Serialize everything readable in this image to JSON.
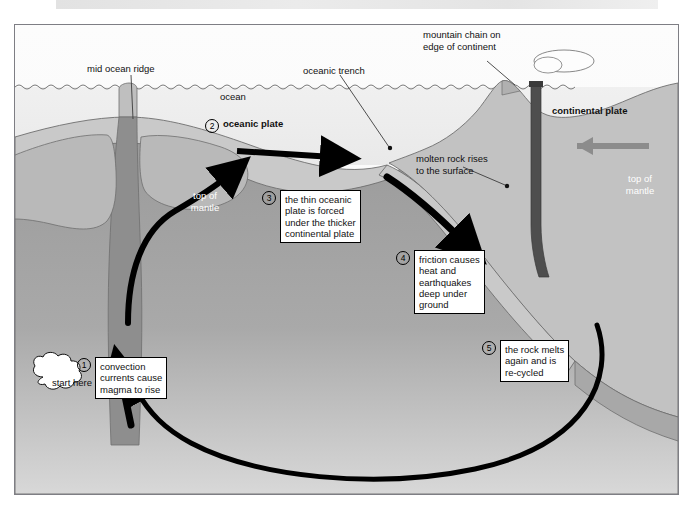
{
  "figure": {
    "border_color": "#7e7e84"
  },
  "palette": {
    "sky": "#fbfbfb",
    "ocean": "#ededed",
    "crust_light": "#c9c9c9",
    "mantle_dark": "#9b9b9b",
    "mantle_fade": "#d6d6d6",
    "magma": "#8e8e8e",
    "arrow_black": "#000000",
    "arrow_grey": "#8c8c8c",
    "plume_white": "#fdfdfd"
  },
  "labels": {
    "mid_ocean_ridge": "mid ocean ridge",
    "ocean": "ocean",
    "oceanic_trench": "oceanic trench",
    "mountain_chain": "mountain chain on\nedge of continent",
    "molten_rock": "molten rock rises\nto the surface",
    "top_of_mantle_left": "top of\nmantle",
    "top_of_mantle_right": "top of\nmantle",
    "oceanic_plate": "oceanic plate",
    "continental_plate": "continental plate",
    "start_here": "start\nhere"
  },
  "steps": [
    {
      "number": "1",
      "text": "convection\ncurrents cause\nmagma to rise"
    },
    {
      "number": "2",
      "text": "oceanic plate"
    },
    {
      "number": "3",
      "text": "the thin oceanic\nplate is forced\nunder the thicker\ncontinental plate"
    },
    {
      "number": "4",
      "text": "friction causes\nheat and\nearthquakes\ndeep under\nground"
    },
    {
      "number": "5",
      "text": "the rock melts\nagain and is\nre-cycled"
    }
  ],
  "icons": {
    "ridge_upwelling": "curved-up-arrow-icon",
    "oceanic_plate_motion": "right-arrow-icon",
    "subduction_motion": "down-right-arrow-icon",
    "continental_plate_motion": "left-arrow-icon",
    "convection_return": "curved-return-arrow-icon",
    "magma_rise": "up-arrow-icon",
    "volcano_plume": "plume-cloud-icon",
    "start_here_cloud": "cloud-callout-icon"
  }
}
